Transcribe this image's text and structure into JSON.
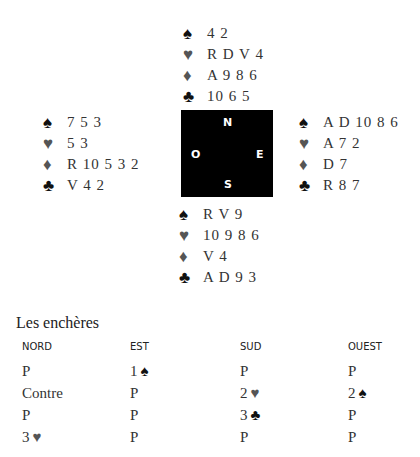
{
  "compass": {
    "north": "N",
    "west": "O",
    "east": "E",
    "south": "S"
  },
  "suit_glyphs": {
    "spade": "♠",
    "heart": "♥",
    "diamond": "♦",
    "club": "♣"
  },
  "colors": {
    "black_suit": "#111111",
    "red_suit_rendered_gray": "#555555",
    "text": "#333333",
    "compass_bg": "#000000"
  },
  "hands": {
    "north": {
      "spades": "4 2",
      "hearts": "R D V 4",
      "diamonds": "A 9 8 6",
      "clubs": "10 6 5"
    },
    "west": {
      "spades": "7 5 3",
      "hearts": "5 3",
      "diamonds": "R 10 5 3 2",
      "clubs": "V 4 2"
    },
    "east": {
      "spades": "A D 10 8 6",
      "hearts": "A 7 2",
      "diamonds": "D 7",
      "clubs": "R 8 7"
    },
    "south": {
      "spades": "R V 9",
      "hearts": "10 9 8 6",
      "diamonds": "V 4",
      "clubs": "A D 9 3"
    }
  },
  "auction": {
    "title": "Les enchères",
    "headers": [
      "NORD",
      "EST",
      "SUD",
      "OUEST"
    ],
    "rows": [
      [
        {
          "text": "P",
          "suit": ""
        },
        {
          "text": "1",
          "suit": "♠"
        },
        {
          "text": "P",
          "suit": ""
        },
        {
          "text": "P",
          "suit": ""
        }
      ],
      [
        {
          "text": "Contre",
          "suit": ""
        },
        {
          "text": "P",
          "suit": ""
        },
        {
          "text": "2",
          "suit": "♥"
        },
        {
          "text": "2",
          "suit": "♠"
        }
      ],
      [
        {
          "text": "P",
          "suit": ""
        },
        {
          "text": "P",
          "suit": ""
        },
        {
          "text": "3",
          "suit": "♣"
        },
        {
          "text": "P",
          "suit": ""
        }
      ],
      [
        {
          "text": "3",
          "suit": "♥"
        },
        {
          "text": "P",
          "suit": ""
        },
        {
          "text": "P",
          "suit": ""
        },
        {
          "text": "P",
          "suit": ""
        }
      ]
    ]
  }
}
